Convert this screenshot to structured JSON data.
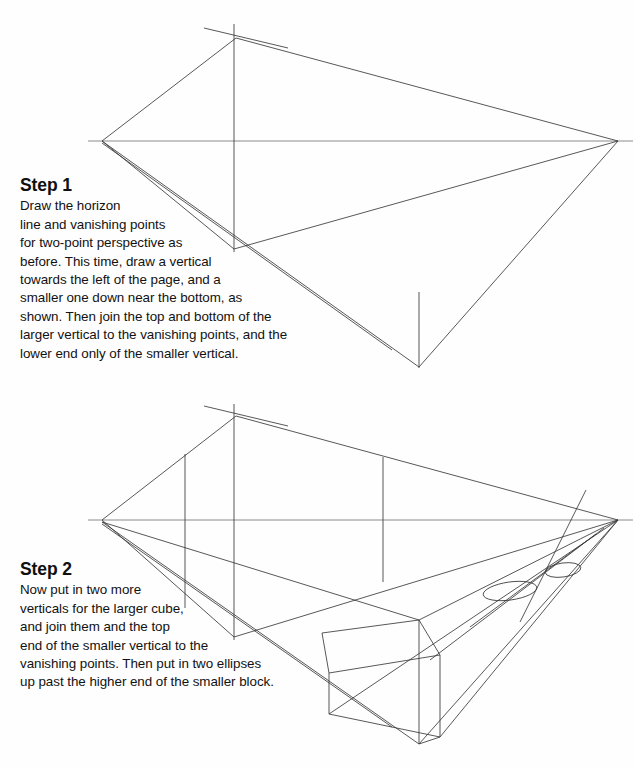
{
  "page": {
    "background_color": "#fefefe",
    "ink_color": "#3a3a3a",
    "text_color": "#121212",
    "width": 633,
    "height": 768
  },
  "steps": [
    {
      "heading": "Step 1",
      "lines": [
        "Draw the horizon",
        "line and vanishing points",
        "for two-point perspective as",
        "before. This time, draw a vertical",
        "towards the left of the page, and a",
        "smaller one down near the bottom, as",
        "shown. Then join the top and bottom of the",
        "larger vertical to the vanishing points, and the",
        "lower end only of the smaller vertical."
      ]
    },
    {
      "heading": "Step 2",
      "lines": [
        "Now put in two more",
        "verticals for the larger cube,",
        "and join them and the top",
        "end of the smaller vertical to the",
        "vanishing points. Then put in two ellipses",
        "up past the higher end of the smaller block."
      ]
    }
  ],
  "diagram_one": {
    "label": "two-point perspective construction, stage one",
    "horizon_line": {
      "x1": 88,
      "y1": 141,
      "x2": 633,
      "y2": 141
    },
    "vanishing_point_left": {
      "x": 102,
      "y": 141
    },
    "vanishing_point_right": {
      "x": 618,
      "y": 141
    },
    "large_vertical": {
      "x": 234,
      "y_top": 24,
      "y_bottom": 252
    },
    "large_vertical_crossing": {
      "x": 236,
      "y": 38
    },
    "small_vertical": {
      "x": 419,
      "y_top": 292,
      "y_bottom": 368
    },
    "elements": [
      "horizon line",
      "left vanishing point",
      "right vanishing point",
      "tall vertical line left of centre",
      "short vertical line near bottom",
      "lines joining top of tall vertical to both vanishing points",
      "lines joining bottom of tall vertical to both vanishing points",
      "lines joining lower end of short vertical to both vanishing points"
    ]
  },
  "diagram_two": {
    "label": "two-point perspective construction, stage two",
    "horizon_line": {
      "x1": 88,
      "y1": 520,
      "x2": 633,
      "y2": 520
    },
    "vanishing_point_left": {
      "x": 102,
      "y": 520
    },
    "vanishing_point_right": {
      "x": 618,
      "y": 520
    },
    "large_vertical": {
      "x": 234,
      "y_top": 404,
      "y_bottom": 640
    },
    "large_vertical_crossing": {
      "x": 236,
      "y": 416
    },
    "extra_vertical_left": {
      "x": 185,
      "y_top": 454,
      "y_bottom": 608
    },
    "extra_vertical_right": {
      "x": 383,
      "y_top": 457,
      "y_bottom": 582
    },
    "small_block_near_vertical": {
      "x": 419,
      "y_top": 620,
      "y_bottom": 744
    },
    "ellipses": [
      {
        "cx": 510,
        "cy": 591,
        "rx": 27,
        "ry": 9,
        "name": "lower-left-ellipse"
      },
      {
        "cx": 563,
        "cy": 570,
        "rx": 18,
        "ry": 7,
        "name": "upper-right-ellipse"
      }
    ],
    "elements": [
      "horizon line",
      "left vanishing point",
      "right vanishing point",
      "two extra verticals for the larger cube",
      "smaller block drawn as a solid box",
      "two ellipses above the higher end of the smaller block"
    ]
  }
}
